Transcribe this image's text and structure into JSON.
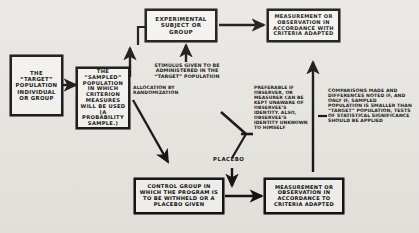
{
  "diagram": {
    "ink_color": "#111111",
    "paper_color": "#e9e7e2",
    "box_fill": "#f4f3ef",
    "boxes": {
      "target_population": "THE “TARGET” POPULATION INDIVIDUAL OR GROUP",
      "sampled_population": "THE “SAMPLED” POPULATION IN WHICH CRITERION MEASURES WILL BE USED (A PROBABILITY SAMPLE.)",
      "experimental_group": "EXPERIMENTAL SUBJECT OR GROUP",
      "measurement_top": "MEASUREMENT OR OBSERVATION IN ACCORDANCE WITH CRITERIA ADAPTED",
      "control_group": "CONTROL GROUP IN WHICH THE PROGRAM IS TO BE WITHHELD OR A PLACEBO GIVEN",
      "measurement_bottom": "MEASUREMENT OR OBSERVATION IN ACCORDANCE TO CRITERIA ADAPTED"
    },
    "labels": {
      "allocation": "ALLOCATION BY RANDOMIZATION",
      "stimulus": "STIMULUS GIVEN TO BE ADMINISTERED IN THE “TARGET” POPULATION",
      "placebo": "PLACEBO",
      "blinding_note": "PREFERABLE IF OBSERVER, OR MEASURER CAN BE KEPT UNAWARE OF OBSERVEE’S IDENTITY. ALSO, OBSERVEE’S IDENTITY UNKNOWN TO HIMSELF",
      "comparison_note": "COMPARISONS MADE AND DIFFERENCES NOTED IF, AND ONLY IF, SAMPLED POPULATION IS SMALLER THAN “TARGET” POPULATION, TESTS OF STATISTICAL SIGNIFICANCE SHOULD BE APPLIED"
    }
  }
}
